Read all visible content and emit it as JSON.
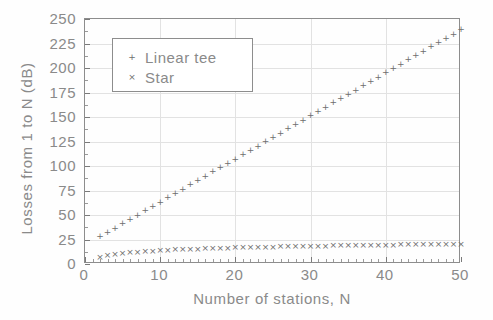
{
  "chart_data": {
    "type": "scatter",
    "title": "",
    "xlabel": "Number of stations, N",
    "ylabel": "Losses from 1 to N (dB)",
    "xlim": [
      0,
      50
    ],
    "ylim": [
      0,
      250
    ],
    "xticks": [
      0,
      10,
      20,
      30,
      40,
      50
    ],
    "yticks": [
      0,
      25,
      50,
      75,
      100,
      125,
      150,
      175,
      200,
      225,
      250
    ],
    "xtick_labels": [
      "0",
      "10",
      "20",
      "30",
      "40",
      "50"
    ],
    "ytick_labels": [
      "0",
      "25",
      "50",
      "75",
      "100",
      "125",
      "150",
      "175",
      "200",
      "225",
      "250"
    ],
    "grid": true,
    "legend_position": "upper-left-inside",
    "series": [
      {
        "name": "Linear tee",
        "marker": "+",
        "color": "#6e6e6e",
        "x": [
          2,
          3,
          4,
          5,
          6,
          7,
          8,
          9,
          10,
          11,
          12,
          13,
          14,
          15,
          16,
          17,
          18,
          19,
          20,
          21,
          22,
          23,
          24,
          25,
          26,
          27,
          28,
          29,
          30,
          31,
          32,
          33,
          34,
          35,
          36,
          37,
          38,
          39,
          40,
          41,
          42,
          43,
          44,
          45,
          46,
          47,
          48,
          49,
          50
        ],
        "y": [
          28.4,
          32.8,
          37.2,
          41.6,
          46.0,
          50.4,
          54.8,
          59.2,
          63.6,
          68.0,
          72.4,
          76.8,
          81.2,
          85.6,
          90.0,
          94.4,
          98.8,
          103.2,
          107.6,
          112.0,
          116.4,
          120.8,
          125.2,
          129.6,
          134.0,
          138.4,
          142.8,
          147.2,
          151.6,
          156.0,
          160.4,
          164.8,
          169.2,
          173.6,
          178.0,
          182.4,
          186.8,
          191.2,
          195.6,
          200.0,
          204.4,
          208.8,
          213.2,
          217.6,
          222.0,
          226.4,
          230.8,
          235.2,
          239.6
        ]
      },
      {
        "name": "Star",
        "marker": "x",
        "color": "#6e6e6e",
        "x": [
          2,
          3,
          4,
          5,
          6,
          7,
          8,
          9,
          10,
          11,
          12,
          13,
          14,
          15,
          16,
          17,
          18,
          19,
          20,
          21,
          22,
          23,
          24,
          25,
          26,
          27,
          28,
          29,
          30,
          31,
          32,
          33,
          34,
          35,
          36,
          37,
          38,
          39,
          40,
          41,
          42,
          43,
          44,
          45,
          46,
          47,
          48,
          49,
          50
        ],
        "y": [
          7.0,
          8.8,
          10.0,
          11.0,
          11.8,
          12.5,
          13.0,
          13.6,
          14.0,
          14.4,
          14.8,
          15.1,
          15.4,
          15.7,
          16.0,
          16.2,
          16.5,
          16.7,
          16.9,
          17.1,
          17.3,
          17.5,
          17.6,
          17.8,
          18.0,
          18.1,
          18.3,
          18.4,
          18.5,
          18.7,
          18.8,
          18.9,
          19.0,
          19.1,
          19.3,
          19.4,
          19.5,
          19.6,
          19.7,
          19.8,
          19.9,
          20.0,
          20.1,
          20.1,
          20.2,
          20.3,
          20.4,
          20.5,
          20.6
        ]
      }
    ]
  },
  "legend": {
    "entries": [
      {
        "marker": "+",
        "label": "Linear tee"
      },
      {
        "marker": "×",
        "label": "Star"
      }
    ]
  },
  "colors": {
    "axis": "#8d8d8d",
    "grid": "#e2e2e2",
    "text": "#8a8a8a",
    "marker": "#6e6e6e",
    "background": "#fefefe"
  }
}
